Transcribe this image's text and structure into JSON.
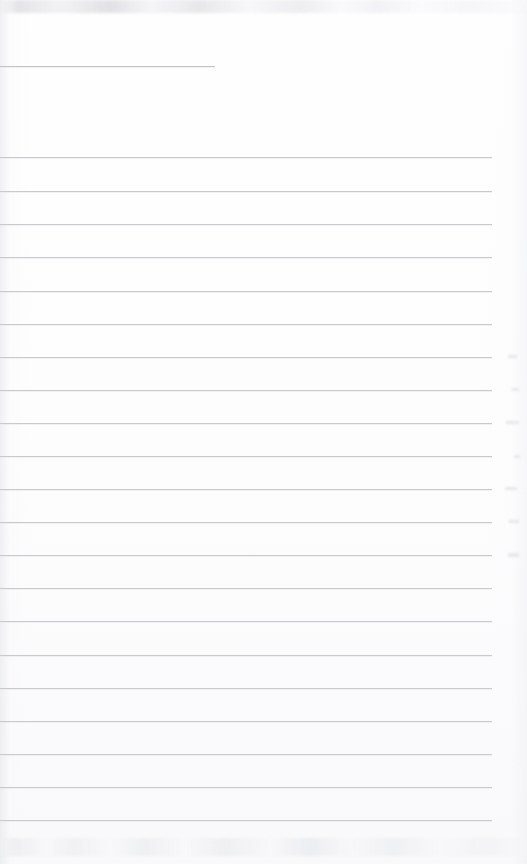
{
  "document": {
    "kind": "scanned-page",
    "description": "Blank ruled notebook page (scan)",
    "page_width": 527,
    "page_height": 864,
    "background_color": "#fefeff",
    "rule_color": "#c9cace",
    "text_content": "",
    "visible_text_lines": []
  },
  "ruling": {
    "line_count": 23,
    "spacing_px": 33,
    "left_x": 0,
    "right_x": 492,
    "lines": [
      {
        "y": 66,
        "x1": 0,
        "x2": 215,
        "kind": "short"
      },
      {
        "y": 157,
        "x1": 0,
        "x2": 492,
        "kind": "full"
      },
      {
        "y": 191,
        "x1": 0,
        "x2": 492,
        "kind": "full"
      },
      {
        "y": 224,
        "x1": 0,
        "x2": 492,
        "kind": "full"
      },
      {
        "y": 257,
        "x1": 0,
        "x2": 492,
        "kind": "full"
      },
      {
        "y": 291,
        "x1": 0,
        "x2": 492,
        "kind": "full"
      },
      {
        "y": 324,
        "x1": 0,
        "x2": 492,
        "kind": "full"
      },
      {
        "y": 357,
        "x1": 0,
        "x2": 492,
        "kind": "full"
      },
      {
        "y": 390,
        "x1": 0,
        "x2": 492,
        "kind": "full"
      },
      {
        "y": 423,
        "x1": 0,
        "x2": 492,
        "kind": "full"
      },
      {
        "y": 456,
        "x1": 0,
        "x2": 492,
        "kind": "full"
      },
      {
        "y": 489,
        "x1": 0,
        "x2": 492,
        "kind": "full"
      },
      {
        "y": 522,
        "x1": 0,
        "x2": 492,
        "kind": "full"
      },
      {
        "y": 555,
        "x1": 0,
        "x2": 492,
        "kind": "full"
      },
      {
        "y": 588,
        "x1": 0,
        "x2": 492,
        "kind": "full"
      },
      {
        "y": 621,
        "x1": 0,
        "x2": 492,
        "kind": "full"
      },
      {
        "y": 655,
        "x1": 0,
        "x2": 492,
        "kind": "full"
      },
      {
        "y": 688,
        "x1": 0,
        "x2": 492,
        "kind": "full"
      },
      {
        "y": 721,
        "x1": 0,
        "x2": 492,
        "kind": "full"
      },
      {
        "y": 754,
        "x1": 0,
        "x2": 492,
        "kind": "full"
      },
      {
        "y": 787,
        "x1": 0,
        "x2": 492,
        "kind": "full"
      },
      {
        "y": 820,
        "x1": 0,
        "x2": 492,
        "kind": "full"
      }
    ]
  },
  "artifacts": {
    "top_smudge": {
      "y": 0,
      "height": 13
    },
    "bottom_ghost_text": {
      "y": 838,
      "height": 18
    },
    "margin_marks": [
      {
        "x": 508,
        "y": 355,
        "w": 9,
        "h": 3
      },
      {
        "x": 512,
        "y": 388,
        "w": 7,
        "h": 3
      },
      {
        "x": 506,
        "y": 421,
        "w": 13,
        "h": 3
      },
      {
        "x": 514,
        "y": 455,
        "w": 6,
        "h": 3
      },
      {
        "x": 505,
        "y": 487,
        "w": 12,
        "h": 3
      },
      {
        "x": 509,
        "y": 520,
        "w": 10,
        "h": 3
      },
      {
        "x": 508,
        "y": 553,
        "w": 11,
        "h": 4
      }
    ]
  }
}
